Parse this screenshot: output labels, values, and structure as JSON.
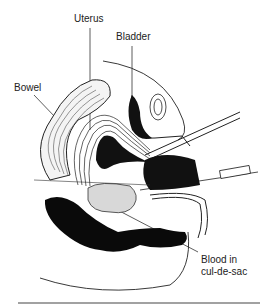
{
  "diagram": {
    "labels": {
      "uterus": "Uterus",
      "bladder": "Bladder",
      "bowel": "Bowel",
      "blood_line1": "Blood in",
      "blood_line2": "cul-de-sac"
    }
  }
}
